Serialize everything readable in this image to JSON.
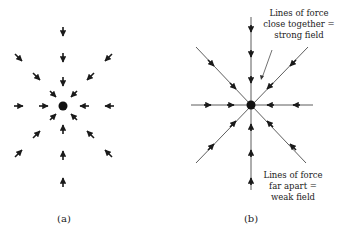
{
  "figure": {
    "panel_a": {
      "label": "(a)",
      "description": "Field arrows pointing inward toward a central charge"
    },
    "panel_b": {
      "label": "(b)",
      "description": "Radial lines of force with inward arrows toward central charge",
      "annotation_top": [
        "Lines of force",
        "close together =",
        "strong field"
      ],
      "annotation_bottom": [
        "Lines of force",
        "far apart =",
        "weak field"
      ]
    }
  },
  "colors": {
    "ink": "#1a1a1a",
    "background": "#ffffff"
  }
}
